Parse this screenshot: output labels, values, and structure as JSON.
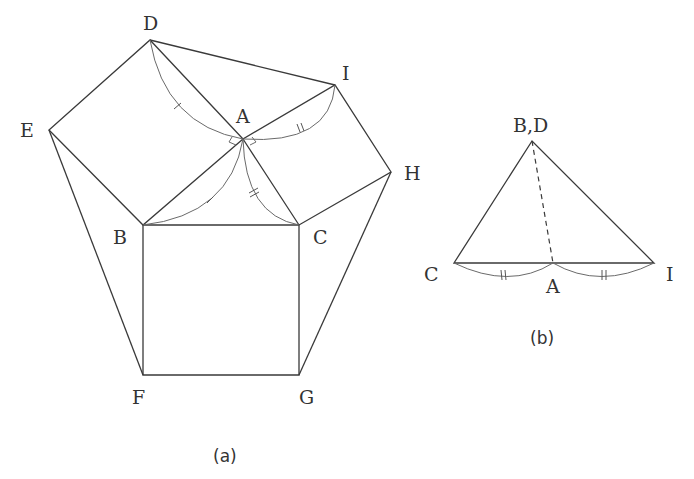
{
  "figure_a": {
    "caption": "(a)",
    "labels": {
      "D": "D",
      "I": "I",
      "A": "A",
      "E": "E",
      "H": "H",
      "B": "B",
      "C": "C",
      "F": "F",
      "G": "G"
    }
  },
  "figure_b": {
    "caption": "(b)",
    "labels": {
      "top": "B,D",
      "C": "C",
      "A": "A",
      "I": "I"
    }
  }
}
